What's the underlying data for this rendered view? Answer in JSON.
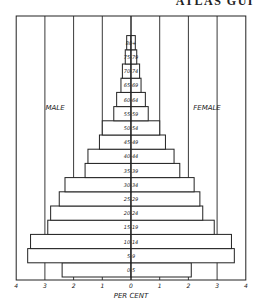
{
  "header": {
    "text": "ATLAS GUI"
  },
  "chart_data": {
    "type": "bar",
    "subtype": "population-pyramid",
    "title": "",
    "xlabel": "PER CENT",
    "ylabel": "",
    "xlim": [
      -4,
      4
    ],
    "x_ticks": [
      "4",
      "3",
      "2",
      "1",
      "0",
      "1",
      "2",
      "3",
      "4"
    ],
    "grid": true,
    "legend": {
      "left_label": "MALE",
      "right_label": "FEMALE"
    },
    "categories": [
      "0-5",
      "5-9",
      "10-14",
      "15-19",
      "20-24",
      "25-29",
      "30-34",
      "35-39",
      "40-44",
      "45-49",
      "50-54",
      "55-59",
      "60-64",
      "65-69",
      "70-74",
      "75-79",
      "80+"
    ],
    "series": [
      {
        "name": "MALE",
        "values": [
          2.4,
          3.6,
          3.5,
          2.9,
          2.8,
          2.5,
          2.3,
          1.6,
          1.5,
          1.1,
          1.0,
          0.6,
          0.5,
          0.35,
          0.3,
          0.2,
          0.15
        ]
      },
      {
        "name": "FEMALE",
        "values": [
          2.1,
          3.6,
          3.5,
          2.9,
          2.5,
          2.4,
          2.2,
          1.7,
          1.5,
          1.2,
          1.0,
          0.6,
          0.5,
          0.35,
          0.3,
          0.2,
          0.15
        ]
      }
    ]
  }
}
